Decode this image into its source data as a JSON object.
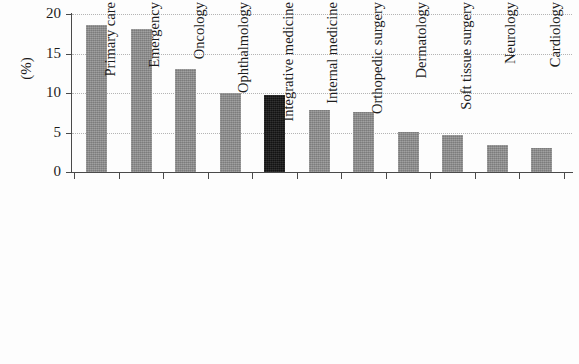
{
  "chart_data": {
    "type": "bar",
    "title": "",
    "xlabel": "",
    "ylabel": "(%)",
    "ylim": [
      0,
      20
    ],
    "yticks": [
      0,
      5,
      10,
      15,
      20
    ],
    "ytick_labels": [
      "0",
      "5",
      "10",
      "15",
      "20"
    ],
    "grid": "horizontal dotted gridlines at 5, 10, 15, 20",
    "legend": "none",
    "categories": [
      "Primary care",
      "Emergency",
      "Oncology",
      "Ophthalmology",
      "Integrative medicine",
      "Internal medicine",
      "Orthopedic surgery",
      "Dermatology",
      "Soft tissue surgery",
      "Neurology",
      "Cardiology"
    ],
    "values": [
      18.6,
      18.1,
      13.1,
      10.0,
      9.7,
      7.8,
      7.6,
      5.1,
      4.7,
      3.4,
      3.0
    ],
    "highlight_index": 4,
    "colors": {
      "bar": "#8d8d8d",
      "highlight_bar": "#161616",
      "axis": "#4a4a4a",
      "gridline": "#b4b4b4",
      "background": "#fdfdfd",
      "text": "#1c1c1c"
    }
  }
}
